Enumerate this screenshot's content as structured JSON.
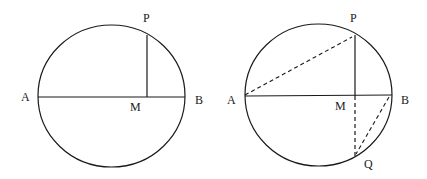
{
  "figure": {
    "stroke_color": "#1a1a1a",
    "background": "#ffffff",
    "left_diagram": {
      "labels": {
        "P": "P",
        "A": "A",
        "M": "M",
        "B": "B"
      },
      "circle": {
        "cx": 111.5,
        "cy": 96,
        "rx": 73.5,
        "ry": 71
      },
      "diameter_AB": {
        "x1": 38,
        "y1": 97,
        "x2": 185,
        "y2": 97
      },
      "segment_PM": {
        "x1": 147,
        "y1": 35,
        "x2": 147,
        "y2": 97
      }
    },
    "right_diagram": {
      "labels": {
        "P": "P",
        "A": "A",
        "M": "M",
        "B": "B",
        "Q": "Q"
      },
      "circle": {
        "cx": 318.5,
        "cy": 95,
        "rx": 73.5,
        "ry": 71
      },
      "diameter_AB": {
        "x1": 245,
        "y1": 96,
        "x2": 392,
        "y2": 95
      },
      "segment_PM_solid": {
        "x1": 355,
        "y1": 35,
        "x2": 355,
        "y2": 96
      },
      "segment_MQ_dashed": {
        "x1": 355,
        "y1": 96,
        "x2": 355,
        "y2": 156
      },
      "segment_AP_dashed": {
        "x1": 245,
        "y1": 95,
        "x2": 352,
        "y2": 37
      },
      "segment_BQ_dashed": {
        "x1": 389,
        "y1": 97,
        "x2": 356,
        "y2": 154
      }
    }
  }
}
